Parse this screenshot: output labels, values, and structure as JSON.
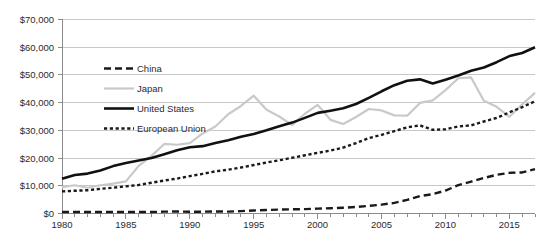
{
  "chart_data": {
    "type": "line",
    "title": "",
    "subtitle": "",
    "xlabel": "",
    "ylabel": "",
    "xlim": [
      1980,
      2017
    ],
    "ylim": [
      0,
      70000
    ],
    "grid": true,
    "legend_position": "inside-upper-left",
    "x_tick_labels": [
      "1980",
      "1985",
      "1990",
      "1995",
      "2000",
      "2005",
      "2010",
      "2015"
    ],
    "x_tick_values": [
      1980,
      1985,
      1990,
      1995,
      2000,
      2005,
      2010,
      2015
    ],
    "y_tick_labels": [
      "$0",
      "$10,000",
      "$20,000",
      "$30,000",
      "$40,000",
      "$50,000",
      "$60,000",
      "$70,000"
    ],
    "y_tick_values": [
      0,
      10000,
      20000,
      30000,
      40000,
      50000,
      60000,
      70000
    ],
    "x": [
      1980,
      1981,
      1982,
      1983,
      1984,
      1985,
      1986,
      1987,
      1988,
      1989,
      1990,
      1991,
      1992,
      1993,
      1994,
      1995,
      1996,
      1997,
      1998,
      1999,
      2000,
      2001,
      2002,
      2003,
      2004,
      2005,
      2006,
      2007,
      2008,
      2009,
      2010,
      2011,
      2012,
      2013,
      2014,
      2015,
      2016,
      2017
    ],
    "series": [
      {
        "name": "China",
        "color": "#1a1a1a",
        "style": "dashed",
        "values": [
          310,
          300,
          290,
          300,
          310,
          300,
          290,
          290,
          370,
          400,
          350,
          360,
          400,
          380,
          470,
          600,
          700,
          780,
          830,
          870,
          960,
          1050,
          1150,
          1290,
          1510,
          1760,
          2100,
          2700,
          3470,
          3830,
          4560,
          5620,
          6320,
          7050,
          7680,
          8070,
          8150,
          8800
        ],
        "end_value_approx": 16000,
        "scaled_note": "as rendered, series rises from near $0 in 1980 to about $16,000 by 2017"
      },
      {
        "name": "Japan",
        "color": "#c9c9c9",
        "style": "solid",
        "values": [
          9500,
          10200,
          9300,
          10200,
          10800,
          11600,
          17200,
          20800,
          25100,
          24800,
          25400,
          28900,
          31400,
          35800,
          38800,
          42500,
          37400,
          35000,
          31900,
          36000,
          39200,
          33800,
          32300,
          34800,
          37700,
          37200,
          35400,
          35300,
          39900,
          40800,
          44500,
          48800,
          49100,
          40700,
          38500,
          34900,
          39400,
          43500
        ],
        "end_value_approx": 43500
      },
      {
        "name": "United States",
        "color": "#111111",
        "style": "solid",
        "values": [
          12500,
          13900,
          14400,
          15500,
          17100,
          18200,
          19100,
          20000,
          21400,
          22800,
          23900,
          24300,
          25400,
          26400,
          27700,
          28700,
          30000,
          31500,
          32800,
          34500,
          36300,
          37100,
          38000,
          39500,
          41700,
          44100,
          46300,
          47900,
          48400,
          46900,
          48300,
          49800,
          51500,
          52700,
          54600,
          56800,
          57900,
          60000
        ],
        "end_value_approx": 60000
      },
      {
        "name": "European Union",
        "color": "#1a1a1a",
        "style": "dotted",
        "values": [
          8000,
          8200,
          8400,
          8900,
          9300,
          9800,
          10300,
          11100,
          11900,
          12600,
          13500,
          14300,
          15200,
          15800,
          16600,
          17500,
          18400,
          19200,
          20100,
          21000,
          21900,
          22700,
          23800,
          25400,
          27200,
          28400,
          29700,
          31100,
          31800,
          30200,
          30400,
          31400,
          31800,
          33200,
          34500,
          36500,
          38400,
          40500
        ],
        "end_value_approx": 40500
      }
    ],
    "legend_entries": [
      "China",
      "Japan",
      "United States",
      "European Union"
    ]
  }
}
